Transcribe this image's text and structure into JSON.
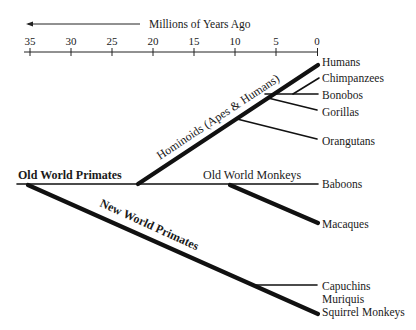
{
  "axis": {
    "title": "Millions of Years Ago",
    "ticks": [
      "35",
      "30",
      "25",
      "20",
      "15",
      "10",
      "5",
      "0"
    ]
  },
  "groups": {
    "old_world_primates": "Old World Primates",
    "hominoids": "Hominoids (Apes & Humans)",
    "old_world_monkeys": "Old World Monkeys",
    "new_world_primates": "New World Primates"
  },
  "taxa": {
    "humans": "Humans",
    "chimpanzees": "Chimpanzees",
    "bonobos": "Bonobos",
    "gorillas": "Gorillas",
    "orangutans": "Orangutans",
    "baboons": "Baboons",
    "macaques": "Macaques",
    "capuchins": "Capuchins",
    "muriquis": "Muriquis",
    "squirrel_monkeys": "Squirrel Monkeys"
  },
  "colors": {
    "line": "#111111",
    "text": "#1a1a1a",
    "background": "#ffffff"
  }
}
